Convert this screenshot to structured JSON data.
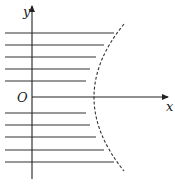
{
  "diagram": {
    "axes": {
      "x_label": "x",
      "y_label": "y",
      "origin_label": "O"
    },
    "curve": {
      "style": "dashed",
      "shape": "hyperbola-branch",
      "opens": "right"
    },
    "hatch_lines": {
      "upper_count": 5,
      "lower_count": 5,
      "region": "left of curve"
    }
  }
}
